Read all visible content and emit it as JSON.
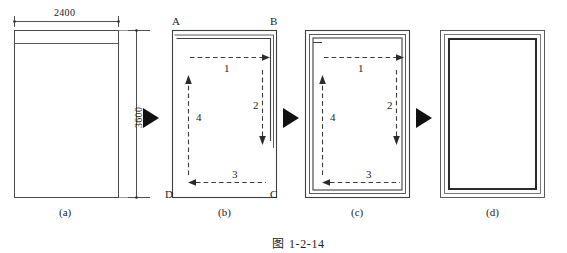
{
  "figure": {
    "caption_prefix": "图",
    "caption_number": "1-2-14",
    "caption_full": "图 1-2-14"
  },
  "panels": [
    {
      "id": "a",
      "label": "(a)",
      "dimensions": {
        "width_label": "2400",
        "height_label": "3600"
      },
      "corner_labels": [],
      "steps": []
    },
    {
      "id": "b",
      "label": "(b)",
      "dimensions": {},
      "corner_labels": [
        {
          "name": "A",
          "position": "top-left"
        },
        {
          "name": "B",
          "position": "top-right"
        },
        {
          "name": "C",
          "position": "bottom-right"
        },
        {
          "name": "D",
          "position": "bottom-left"
        }
      ],
      "steps": [
        {
          "number": "1",
          "direction": "right"
        },
        {
          "number": "2",
          "direction": "down"
        },
        {
          "number": "3",
          "direction": "left"
        },
        {
          "number": "4",
          "direction": "up"
        }
      ]
    },
    {
      "id": "c",
      "label": "(c)",
      "dimensions": {},
      "corner_labels": [],
      "steps": [
        {
          "number": "1",
          "direction": "right"
        },
        {
          "number": "2",
          "direction": "down"
        },
        {
          "number": "3",
          "direction": "left"
        },
        {
          "number": "4",
          "direction": "up"
        }
      ]
    },
    {
      "id": "d",
      "label": "(d)",
      "dimensions": {},
      "corner_labels": [],
      "steps": []
    }
  ],
  "flow_arrows": [
    {
      "name": "arrow-a-to-b"
    },
    {
      "name": "arrow-b-to-c"
    },
    {
      "name": "arrow-c-to-d"
    }
  ],
  "colors": {
    "line": "#2b2b2b",
    "thin_line": "#555555",
    "dashed": "#3a3a3a",
    "text": "#1d1d1d",
    "background": "#ffffff"
  }
}
